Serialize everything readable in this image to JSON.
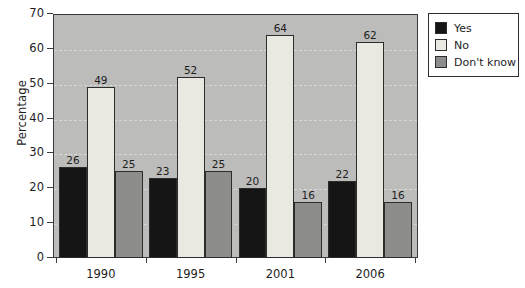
{
  "chart_data": {
    "type": "bar",
    "title": "",
    "xlabel": "",
    "ylabel": "Percentage",
    "categories": [
      "1990",
      "1995",
      "2001",
      "2006"
    ],
    "series": [
      {
        "name": "Yes",
        "color": "#151515",
        "values": [
          26,
          23,
          20,
          22
        ]
      },
      {
        "name": "No",
        "color": "#e9e9e1",
        "values": [
          49,
          52,
          64,
          62
        ]
      },
      {
        "name": "Don't know",
        "color": "#8d8d8b",
        "values": [
          25,
          25,
          16,
          16
        ]
      }
    ],
    "ylim": [
      0,
      70
    ],
    "ytick_values": [
      0,
      10,
      20,
      30,
      40,
      50,
      60,
      70
    ],
    "ytick_labels": [
      "0",
      "10",
      "20",
      "30",
      "40",
      "50",
      "60",
      "70"
    ],
    "grid": true,
    "grid_style": "dashed",
    "legend_position": "top-right",
    "data_labels": true,
    "plot_background": "#bcbcba"
  }
}
